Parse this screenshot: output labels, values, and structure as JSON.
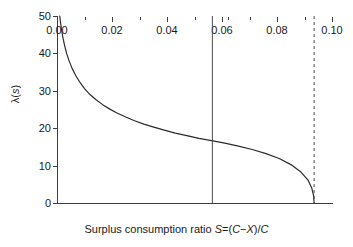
{
  "chart_data": {
    "type": "line",
    "title": "",
    "subtitle": "",
    "xlabel": "Surplus consumption ratio S=(C−X)/C",
    "xlabel_parts": {
      "prefix": "Surplus consumption ratio ",
      "sym_s": "S",
      "eq": "=(",
      "sym_c1": "C",
      "minus": "−",
      "sym_x": "X",
      "close": ")/",
      "sym_c2": "C"
    },
    "ylabel": "λ(s)",
    "ylabel_parts": {
      "lambda": "λ(",
      "sym_s": "s",
      "close": ")"
    },
    "xlim": [
      0.0,
      0.1
    ],
    "ylim": [
      0,
      50
    ],
    "grid": false,
    "legend": "none",
    "xticks": [
      0.0,
      0.02,
      0.04,
      0.06,
      0.08,
      0.1
    ],
    "xtick_labels": [
      "0.00",
      "0.02",
      "0.04",
      "0.06",
      "0.08",
      "0.10"
    ],
    "xticks_minor": [
      0.01,
      0.03,
      0.05,
      0.062,
      0.07,
      0.09
    ],
    "yticks": [
      0,
      10,
      20,
      30,
      40,
      50
    ],
    "ytick_labels": [
      "0",
      "10",
      "20",
      "30",
      "40",
      "50"
    ],
    "series": [
      {
        "name": "lambda(s)",
        "color": "#2b2b2b",
        "style": "solid",
        "x": [
          0.001,
          0.0013,
          0.0017,
          0.0022,
          0.0028,
          0.0035,
          0.0044,
          0.0055,
          0.0068,
          0.0083,
          0.01,
          0.012,
          0.0142,
          0.0166,
          0.0192,
          0.022,
          0.025,
          0.0282,
          0.0316,
          0.0352,
          0.039,
          0.043,
          0.0472,
          0.0516,
          0.0562,
          0.061,
          0.066,
          0.071,
          0.076,
          0.0808,
          0.0852,
          0.0888,
          0.0912,
          0.0926,
          0.0933,
          0.0935
        ],
        "y": [
          50.0,
          48.2,
          46.1,
          44.0,
          42.0,
          40.0,
          38.0,
          36.0,
          34.1,
          32.3,
          30.6,
          29.0,
          27.6,
          26.3,
          25.1,
          24.0,
          23.0,
          22.0,
          21.1,
          20.3,
          19.5,
          18.7,
          18.0,
          17.3,
          16.7,
          16.0,
          15.2,
          14.3,
          13.2,
          11.9,
          10.2,
          8.2,
          6.2,
          4.1,
          2.0,
          0.0
        ]
      }
    ],
    "annotations": [
      {
        "name": "steady-state-line",
        "type": "vline",
        "x": 0.0565,
        "style": "solid",
        "color": "#4a4a4a",
        "label": ""
      },
      {
        "name": "upper-bound-line",
        "type": "vline",
        "x": 0.0935,
        "style": "dashed",
        "color": "#4a4a4a",
        "label": ""
      }
    ]
  }
}
